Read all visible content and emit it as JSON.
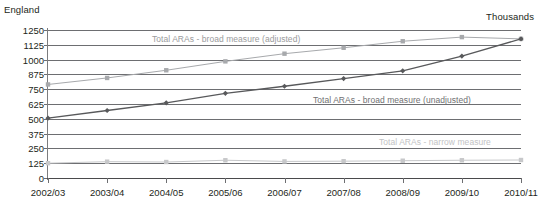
{
  "header": {
    "region_label": "England",
    "units_label": "Thousands"
  },
  "chart_data": {
    "type": "line",
    "title": "",
    "subtitle": "",
    "xlabel": "",
    "ylabel": "Thousands",
    "region": "England",
    "grid": true,
    "legend_position": "inline-annotations",
    "categories": [
      "2002/03",
      "2003/04",
      "2004/05",
      "2005/06",
      "2006/07",
      "2007/08",
      "2008/09",
      "2009/10",
      "2010/11"
    ],
    "ylim": [
      0,
      1250
    ],
    "yticks": [
      0,
      125,
      250,
      375,
      500,
      625,
      750,
      875,
      1000,
      1125,
      1250
    ],
    "series": [
      {
        "name": "Total ARAs - broad measure (adjusted)",
        "color": "#a7a9ac",
        "marker": "square",
        "values": [
          790,
          845,
          910,
          985,
          1050,
          1100,
          1155,
          1190,
          1175
        ]
      },
      {
        "name": "Total ARAs - broad measure (unadjusted)",
        "color": "#58595b",
        "marker": "diamond",
        "values": [
          505,
          570,
          635,
          715,
          775,
          840,
          905,
          1030,
          1175
        ]
      },
      {
        "name": "Total ARAs - narrow measure",
        "color": "#c7c8ca",
        "marker": "square",
        "values": [
          125,
          138,
          135,
          150,
          140,
          142,
          146,
          150,
          152
        ]
      }
    ],
    "annotations": [
      {
        "text": "Total ARAs - broad measure (adjusted)",
        "series": "Total ARAs - broad measure (adjusted)"
      },
      {
        "text": "Total ARAs - broad measure (unadjusted)",
        "series": "Total ARAs - broad measure (unadjusted)"
      },
      {
        "text": "Total ARAs - narrow measure",
        "series": "Total ARAs - narrow measure"
      }
    ]
  }
}
